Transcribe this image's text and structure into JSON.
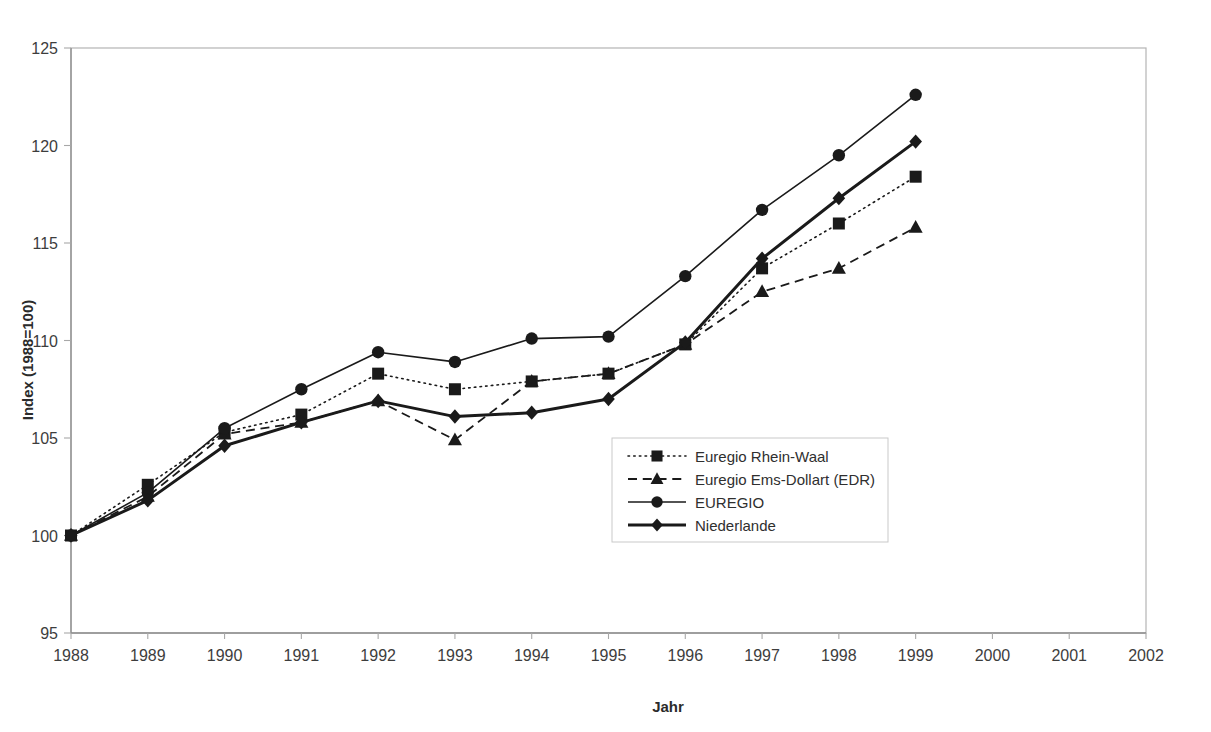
{
  "chart_data": {
    "type": "line",
    "title": "",
    "xlabel": "Jahr",
    "ylabel": "Index (1988=100)",
    "x": [
      1988,
      1989,
      1990,
      1991,
      1992,
      1993,
      1994,
      1995,
      1996,
      1997,
      1998,
      1999
    ],
    "xtick_labels": [
      "1988",
      "1989",
      "1990",
      "1991",
      "1992",
      "1993",
      "1994",
      "1995",
      "1996",
      "1997",
      "1998",
      "1999",
      "2000",
      "2001",
      "2002"
    ],
    "xlim": [
      1988,
      2002
    ],
    "ylim": [
      95,
      125
    ],
    "ytick_labels": [
      "95",
      "100",
      "105",
      "110",
      "115",
      "120",
      "125"
    ],
    "ytick_values": [
      95,
      100,
      105,
      110,
      115,
      120,
      125
    ],
    "grid": false,
    "legend_position": "center",
    "series": [
      {
        "name": "Euregio Rhein-Waal",
        "marker": "square",
        "line_style": "dotted",
        "line_width": 1.6,
        "color": "#1a1a1a",
        "values": [
          100.0,
          102.6,
          105.3,
          106.2,
          108.3,
          107.5,
          107.9,
          108.3,
          109.8,
          113.7,
          116.0,
          118.4
        ]
      },
      {
        "name": "Euregio Ems-Dollart (EDR)",
        "marker": "triangle",
        "line_style": "dashed",
        "line_width": 1.8,
        "color": "#1a1a1a",
        "values": [
          100.0,
          102.0,
          105.2,
          105.8,
          106.9,
          104.9,
          107.9,
          108.3,
          109.8,
          112.5,
          113.7,
          115.8
        ]
      },
      {
        "name": "EUREGIO",
        "marker": "circle",
        "line_style": "solid",
        "line_width": 1.6,
        "color": "#1a1a1a",
        "values": [
          100.0,
          102.2,
          105.5,
          107.5,
          109.4,
          108.9,
          110.1,
          110.2,
          113.3,
          116.7,
          119.5,
          122.6
        ]
      },
      {
        "name": "Niederlande",
        "marker": "diamond",
        "line_style": "solid",
        "line_width": 3.0,
        "color": "#1a1a1a",
        "values": [
          100.0,
          101.8,
          104.6,
          105.8,
          106.9,
          106.1,
          106.3,
          107.0,
          109.9,
          114.2,
          117.3,
          120.2
        ]
      }
    ]
  },
  "legend": {
    "items": [
      {
        "label": "Euregio Rhein-Waal"
      },
      {
        "label": "Euregio Ems-Dollart (EDR)"
      },
      {
        "label": "EUREGIO"
      },
      {
        "label": "Niederlande"
      }
    ]
  }
}
